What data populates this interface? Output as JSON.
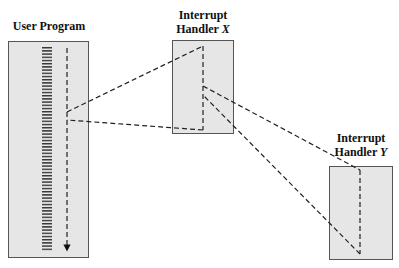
{
  "diagram": {
    "colors": {
      "box_fill": "#e6e6e6",
      "box_border": "#555555",
      "line": "#222222"
    },
    "nodes": [
      {
        "id": "user",
        "label": "User Program",
        "label_line1": "User Program",
        "label_line2": "",
        "box": {
          "x": 8,
          "y": 41,
          "w": 81,
          "h": 217
        }
      },
      {
        "id": "hx",
        "label": "Interrupt Handler X",
        "label_line1": "Interrupt",
        "label_line2": "Handler ",
        "label_var": "X",
        "box": {
          "x": 172,
          "y": 40,
          "w": 62,
          "h": 94
        }
      },
      {
        "id": "hy",
        "label": "Interrupt Handler Y",
        "label_line1": "Interrupt",
        "label_line2": "Handler ",
        "label_var": "Y",
        "box": {
          "x": 329,
          "y": 166,
          "w": 64,
          "h": 94
        }
      }
    ],
    "edges": [
      {
        "from": "user",
        "to": "hx",
        "type": "interrupt",
        "x1": 67,
        "y1": 112,
        "x2": 203,
        "y2": 46
      },
      {
        "from": "hx",
        "to": "user",
        "type": "return",
        "x1": 203,
        "y1": 130,
        "x2": 67,
        "y2": 120
      },
      {
        "from": "hx",
        "to": "hy",
        "type": "interrupt",
        "x1": 203,
        "y1": 86,
        "x2": 360,
        "y2": 170
      },
      {
        "from": "hy",
        "to": "hx",
        "type": "return",
        "x1": 360,
        "y1": 254,
        "x2": 203,
        "y2": 95
      }
    ]
  }
}
